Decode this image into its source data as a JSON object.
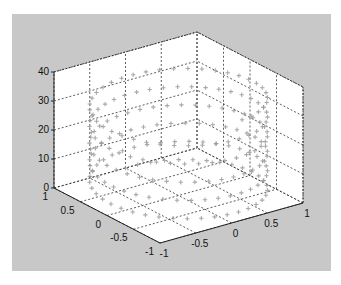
{
  "figure": {
    "background": "#c8c8c8",
    "axes_background": "#ffffff",
    "grid_color": "#333333",
    "marker_color": "#9a9a9a"
  },
  "chart_data": {
    "type": "line3d",
    "title": "",
    "xlabel": "",
    "ylabel": "",
    "zlabel": "",
    "parametric": {
      "x": "sin(t)",
      "y": "cos(t)",
      "z": "t",
      "t_range": [
        0,
        34.5
      ],
      "turns": 5.5
    },
    "marker": "+",
    "grid": true,
    "xlim": [
      -1,
      1
    ],
    "ylim": [
      -1,
      1
    ],
    "zlim": [
      0,
      40
    ],
    "x_ticks": [
      "-1",
      "-0.5",
      "0",
      "0.5",
      "1"
    ],
    "y_ticks": [
      "1",
      "0.5",
      "0",
      "-0.5",
      "-1"
    ],
    "z_ticks": [
      "0",
      "10",
      "20",
      "30",
      "40"
    ]
  },
  "axes": {
    "z_ticks": [
      {
        "label": "0",
        "value": 0
      },
      {
        "label": "10",
        "value": 10
      },
      {
        "label": "20",
        "value": 20
      },
      {
        "label": "30",
        "value": 30
      },
      {
        "label": "40",
        "value": 40
      }
    ],
    "left_ticks": [
      {
        "label": "1",
        "value": 1
      },
      {
        "label": "0.5",
        "value": 0.5
      },
      {
        "label": "0",
        "value": 0
      },
      {
        "label": "-0.5",
        "value": -0.5
      },
      {
        "label": "-1",
        "value": -1
      }
    ],
    "right_ticks": [
      {
        "label": "-1",
        "value": -1
      },
      {
        "label": "-0.5",
        "value": -0.5
      },
      {
        "label": "0",
        "value": 0
      },
      {
        "label": "0.5",
        "value": 0.5
      },
      {
        "label": "1",
        "value": 1
      }
    ]
  }
}
